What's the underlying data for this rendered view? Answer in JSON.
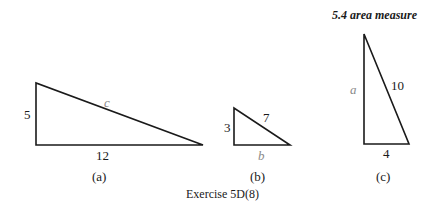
{
  "header": {
    "section": "5.4",
    "title": "area measure",
    "text": "5.4  area measure"
  },
  "figures": [
    {
      "id": "a",
      "caption": "(a)",
      "labels": {
        "vertical": "5",
        "horizontal": "12",
        "hypotenuse": "c"
      }
    },
    {
      "id": "b",
      "caption": "(b)",
      "labels": {
        "vertical": "3",
        "horizontal": "b",
        "hypotenuse": "7"
      }
    },
    {
      "id": "c",
      "caption": "(c)",
      "labels": {
        "vertical": "a",
        "horizontal": "4",
        "hypotenuse": "10"
      }
    }
  ],
  "caption": "Exercise 5D(8)",
  "colors": {
    "line": "#1a1a1a",
    "unknown_label": "#8a8a8a"
  }
}
